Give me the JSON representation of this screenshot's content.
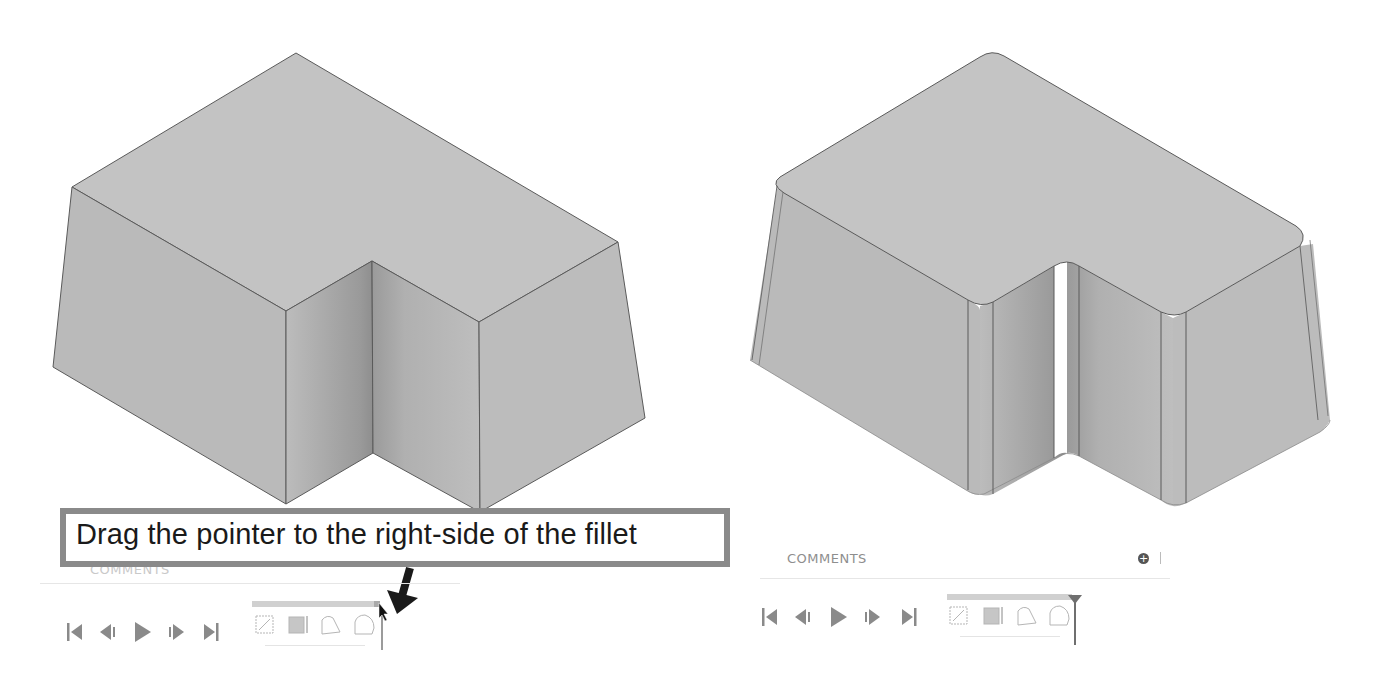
{
  "callout": {
    "text": "Drag the pointer to the right-side of the fillet"
  },
  "left_panel": {
    "comments_label": "COMMENTS",
    "model_state": "before fillet (sharp edges)",
    "playback": [
      {
        "name": "go-to-start",
        "icon": "skip-start-icon"
      },
      {
        "name": "step-back",
        "icon": "step-back-icon"
      },
      {
        "name": "play",
        "icon": "play-icon"
      },
      {
        "name": "step-forward",
        "icon": "step-forward-icon"
      },
      {
        "name": "go-to-end",
        "icon": "skip-end-icon"
      }
    ],
    "timeline_features": [
      {
        "name": "sketch",
        "icon": "sketch-icon"
      },
      {
        "name": "extrude",
        "icon": "extrude-icon"
      },
      {
        "name": "draft",
        "icon": "draft-icon"
      },
      {
        "name": "fillet",
        "icon": "fillet-icon"
      }
    ]
  },
  "right_panel": {
    "comments_label": "COMMENTS",
    "add_comment_glyph": "+",
    "model_state": "after fillet (rounded edges)",
    "playback": [
      {
        "name": "go-to-start",
        "icon": "skip-start-icon"
      },
      {
        "name": "step-back",
        "icon": "step-back-icon"
      },
      {
        "name": "play",
        "icon": "play-icon"
      },
      {
        "name": "step-forward",
        "icon": "step-forward-icon"
      },
      {
        "name": "go-to-end",
        "icon": "skip-end-icon"
      }
    ],
    "timeline_features": [
      {
        "name": "sketch",
        "icon": "sketch-icon"
      },
      {
        "name": "extrude",
        "icon": "extrude-icon"
      },
      {
        "name": "draft",
        "icon": "draft-icon"
      },
      {
        "name": "fillet",
        "icon": "fillet-icon"
      }
    ]
  },
  "colors": {
    "face": "#bdbdbd",
    "face_top": "#c4c4c4",
    "edge": "#5a5a5a",
    "callout_border": "#8a8a8a",
    "arrow": "#1a1a1a",
    "playback": "#8a8a8a"
  }
}
